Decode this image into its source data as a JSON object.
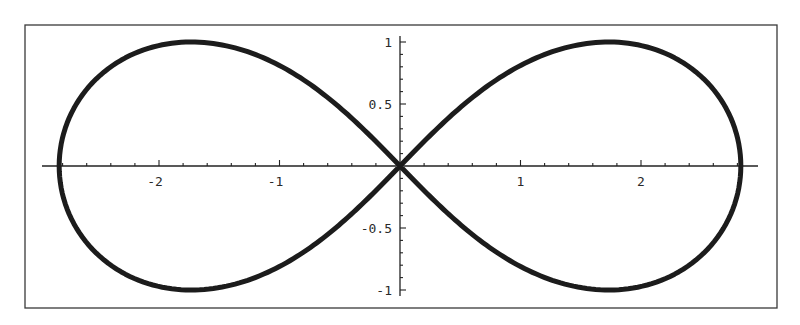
{
  "chart_data": {
    "type": "line",
    "title": "",
    "xlabel": "",
    "ylabel": "",
    "xlim": [
      -3.0,
      3.0
    ],
    "ylim": [
      -1.0,
      1.0
    ],
    "grid": false,
    "legend": null,
    "curve_description": "Lemniscate of Bernoulli (x^2+y^2)^2 = 8(x^2 - y^2), parametric x = a cos t/(1+sin^2 t), y = a sin t cos t/(1+sin^2 t), a = 2*sqrt(2)",
    "parametric": {
      "a": 2.8284271,
      "t_min": 0,
      "t_max": 6.2831853,
      "samples": 400
    },
    "key_points": [
      {
        "x": 0.0,
        "y": 0.0,
        "label": "center crossing"
      },
      {
        "x": 2.83,
        "y": 0.0,
        "label": "right x-intercept"
      },
      {
        "x": -2.83,
        "y": 0.0,
        "label": "left x-intercept"
      },
      {
        "x": 1.73,
        "y": 1.0,
        "label": "upper-right peak"
      },
      {
        "x": -1.73,
        "y": 1.0,
        "label": "upper-left peak"
      },
      {
        "x": 1.73,
        "y": -1.0,
        "label": "lower-right trough"
      },
      {
        "x": -1.73,
        "y": -1.0,
        "label": "lower-left trough"
      }
    ],
    "series": [
      {
        "name": "lemniscate",
        "x": [
          2.83,
          2.67,
          2.27,
          1.73,
          1.13,
          0.55,
          0.0,
          -0.55,
          -1.13,
          -1.73,
          -2.27,
          -2.67,
          -2.83,
          -2.67,
          -2.27,
          -1.73,
          -1.13,
          -0.55,
          0.0,
          0.55,
          1.13,
          1.73,
          2.27,
          2.67,
          2.83
        ],
        "y": [
          0.0,
          0.53,
          0.87,
          1.0,
          0.88,
          0.52,
          0.0,
          -0.52,
          -0.88,
          -1.0,
          -0.87,
          -0.53,
          0.0,
          0.53,
          0.87,
          1.0,
          0.88,
          0.52,
          0.0,
          -0.52,
          -0.88,
          -1.0,
          -0.87,
          -0.53,
          0.0
        ]
      }
    ],
    "x_ticks": {
      "major": [
        -2,
        -1,
        1,
        2
      ],
      "labels": [
        "-2",
        "-1",
        "1",
        "2"
      ],
      "minor_step": 0.2
    },
    "y_ticks": {
      "major": [
        -1,
        -0.5,
        0.5,
        1
      ],
      "labels": [
        "-1",
        "-0.5",
        "0.5",
        "1"
      ],
      "minor_step": 0.1
    }
  },
  "colors": {
    "curve": "#1c1c1c",
    "axes": "#222222",
    "frame": "#3a3a3a",
    "background": "#ffffff",
    "text": "#2a2a2a"
  },
  "layout": {
    "frame": {
      "left": 25,
      "top": 25,
      "right": 777,
      "bottom": 308
    },
    "origin_px": {
      "x": 400,
      "y": 166
    },
    "px_per_unit_x": 120.5,
    "px_per_unit_y": 124,
    "x_axis_extent_px": [
      42,
      758
    ],
    "y_axis_extent_px": [
      36,
      296
    ]
  }
}
